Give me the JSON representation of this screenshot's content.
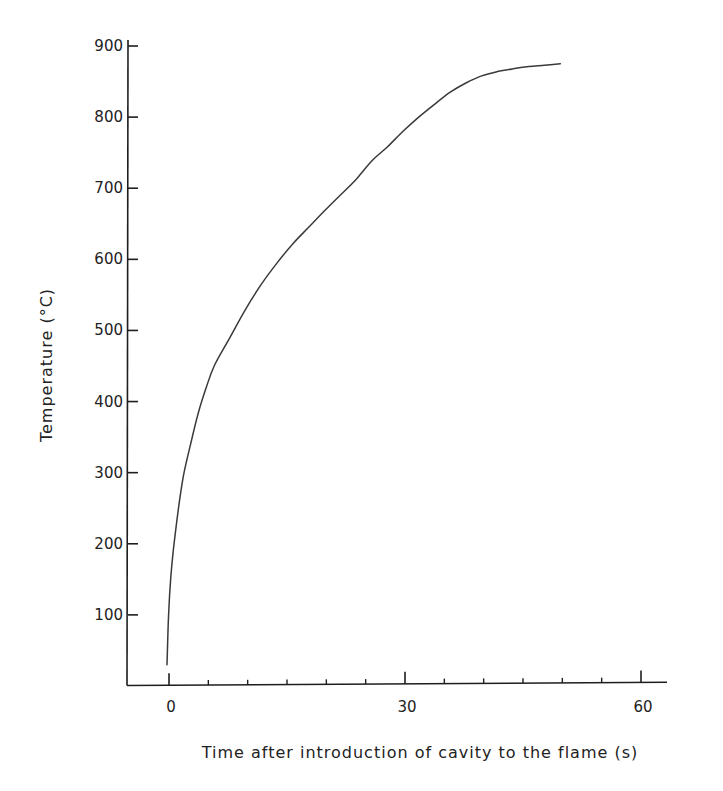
{
  "chart_data": {
    "type": "line",
    "title": "",
    "xlabel": "Time after introduction of cavity to the flame (s)",
    "ylabel": "Temperature (°C)",
    "xlim": [
      -5,
      63
    ],
    "ylim": [
      0,
      900
    ],
    "x_ticks": [
      0,
      30,
      60
    ],
    "x_minor_step": 5,
    "y_ticks": [
      100,
      200,
      300,
      400,
      500,
      600,
      700,
      800,
      900
    ],
    "grid": false,
    "legend": null,
    "series": [
      {
        "name": "Temperature",
        "color": "#3a3a3a",
        "x": [
          0,
          0.2,
          0.5,
          1,
          2,
          3,
          4,
          5,
          6,
          8,
          10,
          12,
          14,
          16,
          18,
          20,
          22,
          24,
          26,
          28,
          30,
          32,
          34,
          36,
          38,
          40,
          42,
          44,
          46,
          48,
          50
        ],
        "y": [
          30,
          100,
          155,
          210,
          290,
          340,
          385,
          420,
          450,
          490,
          530,
          565,
          595,
          622,
          645,
          668,
          690,
          712,
          738,
          758,
          780,
          800,
          818,
          835,
          848,
          858,
          864,
          868,
          871,
          873,
          875
        ]
      }
    ]
  },
  "axes": {
    "x_tick_labels": [
      "0",
      "30",
      "60"
    ],
    "y_tick_labels": [
      "100",
      "200",
      "300",
      "400",
      "500",
      "600",
      "700",
      "800",
      "900"
    ],
    "x_title": "Time after introduction of cavity to the flame (s)",
    "y_title": "Temperature (°C)"
  }
}
